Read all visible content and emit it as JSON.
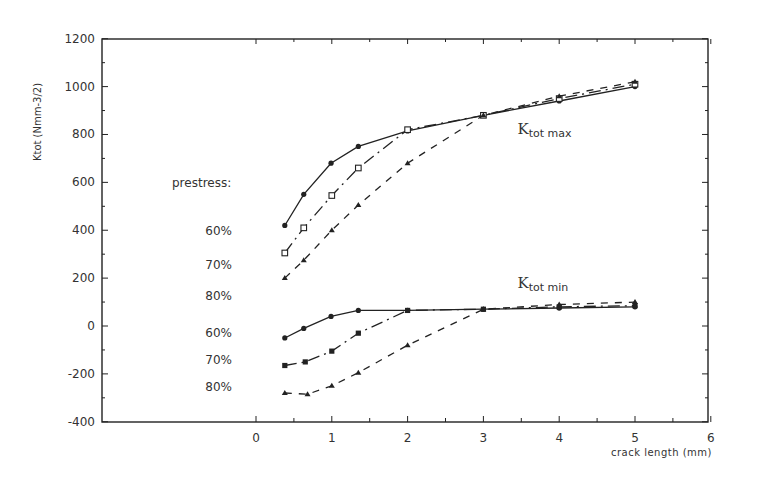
{
  "chart_data": {
    "type": "line",
    "title": "",
    "xlabel": "crack length (mm)",
    "ylabel": "Ktot (Nmm-3/2)",
    "xlim": [
      -2.06,
      6
    ],
    "ylim": [
      -400,
      1200
    ],
    "x_ticks": [
      0,
      1,
      2,
      3,
      4,
      5,
      6
    ],
    "y_ticks": [
      -400,
      -200,
      0,
      200,
      400,
      600,
      800,
      1000,
      1200
    ],
    "grid": false,
    "legend_title": "prestress:",
    "annotations": [
      {
        "text": "K",
        "sub": "tot max",
        "x": 3.45,
        "y": 800
      },
      {
        "text": "K",
        "sub": "tot min",
        "x": 3.45,
        "y": 160
      }
    ],
    "side_labels": [
      {
        "text": "60%",
        "y": 395
      },
      {
        "text": "70%",
        "y": 255
      },
      {
        "text": "80%",
        "y": 125
      },
      {
        "text": "60%",
        "y": -30
      },
      {
        "text": "70%",
        "y": -140
      },
      {
        "text": "80%",
        "y": -255
      }
    ],
    "series": [
      {
        "name": "Ktot max, prestress 60%",
        "style": "solid",
        "marker": "filled-circle",
        "x": [
          0.38,
          0.63,
          0.99,
          1.35,
          2.0,
          3.0,
          4.0,
          5.0
        ],
        "y": [
          420,
          550,
          680,
          750,
          815,
          880,
          940,
          1000
        ]
      },
      {
        "name": "Ktot max, prestress 70%",
        "style": "dash-dot",
        "marker": "open-square",
        "x": [
          0.38,
          0.63,
          1.0,
          1.35,
          2.0,
          3.0,
          4.0,
          5.0
        ],
        "y": [
          305,
          410,
          545,
          660,
          820,
          880,
          950,
          1010
        ]
      },
      {
        "name": "Ktot max, prestress 80%",
        "style": "dashed",
        "marker": "triangle",
        "x": [
          0.38,
          0.63,
          1.0,
          1.35,
          2.0,
          3.0,
          4.0,
          5.0
        ],
        "y": [
          200,
          275,
          400,
          505,
          680,
          880,
          960,
          1020
        ]
      },
      {
        "name": "Ktot min, prestress 60%",
        "style": "solid",
        "marker": "filled-circle",
        "x": [
          0.38,
          0.63,
          0.99,
          1.35,
          2.0,
          3.0,
          4.0,
          5.0
        ],
        "y": [
          -50,
          -10,
          40,
          65,
          65,
          70,
          75,
          80
        ]
      },
      {
        "name": "Ktot min, prestress 70%",
        "style": "dash-dot",
        "marker": "filled-square",
        "x": [
          0.38,
          0.65,
          1.0,
          1.35,
          2.0,
          3.0,
          4.0,
          5.0
        ],
        "y": [
          -165,
          -150,
          -105,
          -30,
          65,
          70,
          80,
          85
        ]
      },
      {
        "name": "Ktot min, prestress 80%",
        "style": "dashed",
        "marker": "triangle",
        "x": [
          0.38,
          0.68,
          1.0,
          1.35,
          2.0,
          3.0,
          4.0,
          5.0
        ],
        "y": [
          -280,
          -285,
          -250,
          -195,
          -80,
          70,
          90,
          100
        ]
      }
    ]
  }
}
